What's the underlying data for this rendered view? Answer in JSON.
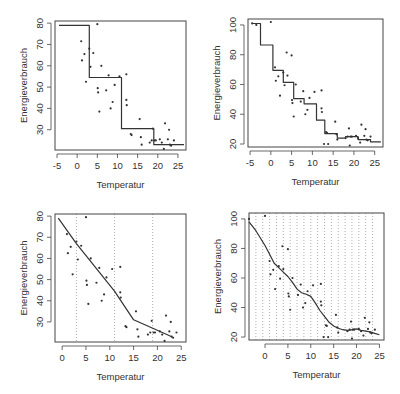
{
  "chart_data": [
    {
      "type": "line",
      "subtype": "step",
      "panel": "top-left",
      "title": "",
      "xlabel": "Temperatur",
      "ylabel": "Energieverbrauch",
      "xticks": [
        -5,
        0,
        5,
        10,
        15,
        20,
        25
      ],
      "yticks": [
        30,
        40,
        50,
        60,
        70,
        80
      ],
      "xlim": [
        -5.5,
        27
      ],
      "ylim": [
        20.5,
        81
      ],
      "box": {
        "x0": 55,
        "y0": 21,
        "x1": 186,
        "y1": 150
      },
      "vlines": [],
      "series": [
        {
          "name": "Regressionsbaum (Stufenfunktion)",
          "x": [
            -4.5,
            3,
            3,
            11,
            11,
            19,
            19,
            26.5
          ],
          "y": [
            79,
            79,
            54.5,
            54.5,
            30.5,
            30.5,
            23,
            23
          ]
        }
      ],
      "points_ref": "data_points"
    },
    {
      "type": "line",
      "subtype": "step",
      "panel": "top-right",
      "title": "",
      "xlabel": "Temperatur",
      "ylabel": "Energieverbrauch",
      "xticks": [
        -5,
        0,
        5,
        10,
        15,
        20,
        25
      ],
      "yticks": [
        20,
        40,
        60,
        80,
        100
      ],
      "xlim": [
        -5.5,
        27
      ],
      "ylim": [
        18,
        104
      ],
      "box": {
        "x0": 248,
        "y0": 19,
        "x1": 383,
        "y1": 147
      },
      "vlines": [],
      "series": [
        {
          "name": "Regressionsbaum (feine Stufen)",
          "x": [
            -4.5,
            -2.5,
            -2.5,
            0.5,
            0.5,
            3,
            3,
            5.5,
            5.5,
            8,
            8,
            11,
            11,
            13,
            13,
            16,
            16,
            18,
            18,
            21,
            21,
            24,
            24,
            26.5
          ],
          "y": [
            101,
            101,
            86.5,
            86.5,
            69.5,
            69.5,
            61.5,
            61.5,
            50.5,
            50.5,
            47,
            47,
            36,
            36,
            27,
            27,
            24,
            24,
            25,
            25,
            23,
            23,
            21.5,
            21.5
          ]
        }
      ],
      "points_ref": "data_points"
    },
    {
      "type": "line",
      "subtype": "piecewise-linear",
      "panel": "bottom-left",
      "title": "",
      "xlabel": "Temperatur",
      "ylabel": "Energieverbrauch",
      "xticks": [
        0,
        5,
        10,
        15,
        20,
        25
      ],
      "yticks": [
        30,
        40,
        50,
        60,
        70,
        80
      ],
      "xlim": [
        -1.5,
        26
      ],
      "ylim": [
        20.5,
        81
      ],
      "box": {
        "x0": 55,
        "y0": 214,
        "x1": 186,
        "y1": 342
      },
      "vlines": [
        3,
        11,
        19
      ],
      "series": [
        {
          "name": "Stückweise lineare Regression",
          "x": [
            -0.8,
            3,
            11,
            15,
            21.5,
            23
          ],
          "y": [
            79,
            67,
            44.5,
            31,
            24.5,
            23
          ]
        }
      ],
      "points_ref": "data_points"
    },
    {
      "type": "line",
      "subtype": "spline",
      "panel": "bottom-right",
      "title": "",
      "xlabel": "Temperatur",
      "ylabel": "Energieverbrauch",
      "xticks": [
        0,
        5,
        10,
        15,
        20,
        25
      ],
      "yticks": [
        20,
        40,
        60,
        80,
        100
      ],
      "xlim": [
        -3.5,
        26
      ],
      "ylim": [
        18,
        104
      ],
      "box": {
        "x0": 249,
        "y0": 213,
        "x1": 384,
        "y1": 340
      },
      "vlines": [
        -2,
        -0.5,
        1,
        2.5,
        4,
        5.5,
        7,
        8.5,
        10,
        11.5,
        13,
        14.5,
        16,
        17.5,
        19,
        20.5,
        22,
        23.5
      ],
      "series": [
        {
          "name": "Spline-Regression",
          "x": [
            -3.5,
            -2,
            0,
            1,
            2,
            3,
            4,
            5,
            6,
            7,
            8,
            9,
            10,
            11,
            12,
            13,
            14,
            15,
            16,
            17,
            18,
            19,
            20,
            21,
            22,
            23,
            24,
            25
          ],
          "y": [
            98,
            92,
            82,
            76,
            70,
            67,
            64,
            61,
            57,
            52.5,
            50,
            49,
            47.5,
            43,
            38,
            34,
            30,
            27.5,
            26,
            25,
            24.5,
            25,
            25.5,
            24.5,
            24,
            23.5,
            22.5,
            21.5
          ]
        }
      ],
      "points_ref": "data_points"
    }
  ],
  "data_points": {
    "x": [
      -4.5,
      -3.5,
      0,
      1,
      1.2,
      1.8,
      2.2,
      3,
      3.3,
      3.8,
      4,
      5,
      5.1,
      5.2,
      5.5,
      6,
      7.2,
      7.8,
      8.3,
      8.8,
      9.3,
      10.5,
      12.2,
      12.2,
      12.3,
      12.8,
      13.3,
      13.5,
      13.8,
      15.5,
      15.8,
      16,
      18,
      18.5,
      18.8,
      19,
      19.2,
      19.5,
      20.5,
      21,
      21.5,
      21.8,
      22.5,
      22.8,
      23,
      23.3,
      24
    ],
    "y": [
      101,
      100,
      102,
      71.5,
      62.5,
      65.5,
      52.5,
      68,
      59.5,
      81.5,
      66,
      79.5,
      49.5,
      47.5,
      38.5,
      60,
      48.5,
      55.5,
      40,
      43,
      51,
      55,
      56,
      44,
      41.5,
      20,
      28,
      27.5,
      20,
      35,
      26.5,
      23,
      24,
      25,
      30.5,
      19,
      25,
      25,
      25.5,
      24,
      21,
      33,
      25.5,
      30,
      23,
      22.5,
      25
    ]
  },
  "labels": {
    "xlabel": "Temperatur",
    "ylabel": "Energieverbrauch"
  },
  "colors": {
    "line": "#333333",
    "points": "#333333",
    "axis": "#444444",
    "vline": "#999999",
    "background": "#ffffff"
  }
}
